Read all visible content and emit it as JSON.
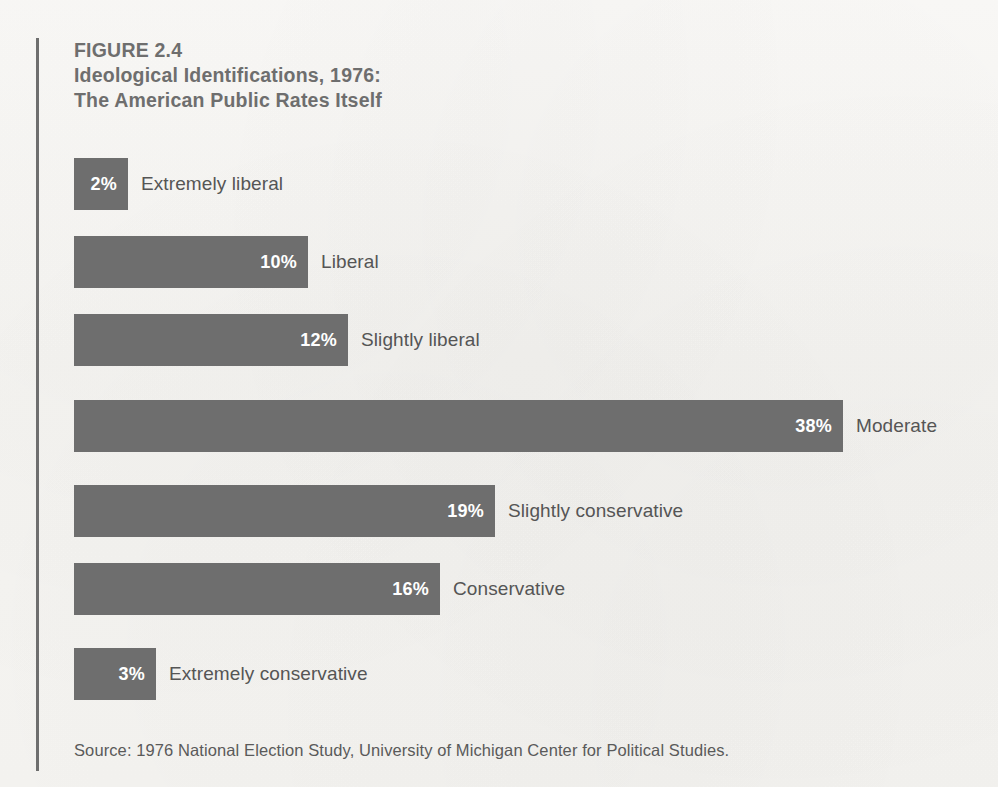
{
  "figure": {
    "number_line": "FIGURE 2.4",
    "title_line_1": "Ideological Identifications, 1976:",
    "title_line_2": "The American Public Rates Itself"
  },
  "source": {
    "text": "Source: 1976 National Election Study, University of Michigan Center for Political Studies."
  },
  "colors": {
    "bar": "#6e6e6e",
    "paper": "#f7f6f3",
    "title_text": "#6e6e6e",
    "label_text": "#555555",
    "value_text": "#ffffff",
    "rule": "#6e6e6e"
  },
  "chart_data": {
    "type": "bar",
    "orientation": "horizontal",
    "title": "FIGURE 2.4 Ideological Identifications, 1976: The American Public Rates Itself",
    "xlabel": "",
    "ylabel": "",
    "xlim": [
      0,
      38
    ],
    "grid": false,
    "legend": "none",
    "value_suffix": "%",
    "categories": [
      "Extremely liberal",
      "Liberal",
      "Slightly liberal",
      "Moderate",
      "Slightly conservative",
      "Conservative",
      "Extremely conservative"
    ],
    "values": [
      2,
      10,
      12,
      38,
      19,
      16,
      3
    ],
    "value_labels": [
      "2%",
      "10%",
      "12%",
      "38%",
      "19%",
      "16%",
      "3%"
    ],
    "bars": [
      {
        "label": "Extremely liberal",
        "value": 2,
        "value_label": "2%",
        "top": 158,
        "width": 54
      },
      {
        "label": "Liberal",
        "value": 10,
        "value_label": "10%",
        "top": 236,
        "width": 234
      },
      {
        "label": "Slightly liberal",
        "value": 12,
        "value_label": "12%",
        "top": 314,
        "width": 274
      },
      {
        "label": "Moderate",
        "value": 38,
        "value_label": "38%",
        "top": 400,
        "width": 769
      },
      {
        "label": "Slightly conservative",
        "value": 19,
        "value_label": "19%",
        "top": 485,
        "width": 421
      },
      {
        "label": "Conservative",
        "value": 16,
        "value_label": "16%",
        "top": 563,
        "width": 366
      },
      {
        "label": "Extremely conservative",
        "value": 3,
        "value_label": "3%",
        "top": 648,
        "width": 82
      }
    ]
  }
}
